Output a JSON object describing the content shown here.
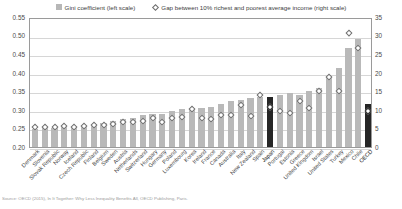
{
  "legend": {
    "items": [
      {
        "label": "Gini coefficient (left scale)",
        "marker": "square-swatch-icon",
        "color": "#b7b7b7"
      },
      {
        "label": "Gap between 10% richest and poorest average income (right scale)",
        "marker": "diamond-marker-icon",
        "color": "#ffffff"
      }
    ]
  },
  "footnote": "Source: OECD (2015), In It Together: Why Less Inequality Benefits All, OECD Publishing, Paris.",
  "axes": {
    "left_ticks": [
      "0.55",
      "0.50",
      "0.45",
      "0.40",
      "0.35",
      "0.30",
      "0.25",
      "0.20"
    ],
    "right_ticks": [
      "35",
      "30",
      "25",
      "20",
      "15",
      "10",
      "5",
      "0"
    ]
  },
  "chart_data": {
    "type": "bar",
    "title": "",
    "xlabel": "",
    "ylabel": "Gini coefficient",
    "y2label": "Gap between 10% richest and poorest average income",
    "ylim": [
      0.2,
      0.55
    ],
    "y2lim": [
      0,
      35
    ],
    "grid": true,
    "legend_position": "top-center",
    "highlight": [
      "Japan",
      "OECD"
    ],
    "categories": [
      "Denmark",
      "Slovenia",
      "Slovak Republic",
      "Norway",
      "Iceland",
      "Czech Republic",
      "Finland",
      "Belgium",
      "Sweden",
      "Austria",
      "Netherlands",
      "Switzerland",
      "Hungary",
      "Germany",
      "Poland",
      "Luxembourg",
      "Korea",
      "Ireland",
      "France",
      "Canada",
      "Australia",
      "Italy",
      "New Zealand",
      "Spain",
      "Japan",
      "Portugal",
      "Estonia",
      "Greece",
      "United Kingdom",
      "Israel",
      "United States",
      "Turkey",
      "Mexico",
      "Chile",
      "OECD"
    ],
    "series": [
      {
        "name": "Gini coefficient (left scale)",
        "axis": "left",
        "type": "bar",
        "color": "#b9b9b9",
        "values": [
          0.249,
          0.25,
          0.25,
          0.253,
          0.253,
          0.256,
          0.26,
          0.265,
          0.269,
          0.276,
          0.278,
          0.285,
          0.288,
          0.289,
          0.298,
          0.302,
          0.302,
          0.304,
          0.309,
          0.316,
          0.324,
          0.327,
          0.333,
          0.335,
          0.336,
          0.341,
          0.346,
          0.34,
          0.351,
          0.36,
          0.389,
          0.412,
          0.466,
          0.491,
          0.315
        ]
      },
      {
        "name": "Gap between 10% richest and poorest average income (right scale)",
        "axis": "right",
        "type": "scatter",
        "marker": "diamond",
        "color": "#ffffff",
        "values": [
          5.2,
          5.3,
          5.3,
          5.5,
          5.4,
          5.6,
          5.7,
          5.9,
          6.0,
          6.6,
          6.7,
          7.0,
          7.6,
          6.6,
          7.7,
          7.9,
          10.1,
          7.6,
          7.4,
          8.6,
          8.5,
          11.3,
          8.2,
          13.8,
          10.7,
          9.6,
          9.1,
          12.3,
          10.5,
          14.9,
          18.8,
          15.1,
          30.5,
          26.5,
          9.6
        ]
      }
    ]
  }
}
